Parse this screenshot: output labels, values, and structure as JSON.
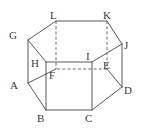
{
  "figure": {
    "name": "hexagonal-prism",
    "canvas": {
      "width": 142,
      "height": 130
    },
    "background_color": "#ffffff",
    "edge_color": "#59595c",
    "hidden_edge_color": "#6b6b70",
    "label_color": "#3a3a3d"
  },
  "vertices": [
    {
      "id": "A",
      "label": "A",
      "x": 28,
      "y": 83,
      "label_x": 10,
      "label_y": 80
    },
    {
      "id": "B",
      "label": "B",
      "x": 46,
      "y": 110,
      "label_x": 37,
      "label_y": 113
    },
    {
      "id": "C",
      "label": "C",
      "x": 92,
      "y": 110,
      "label_x": 85,
      "label_y": 113
    },
    {
      "id": "D",
      "label": "D",
      "x": 122,
      "y": 87,
      "label_x": 124,
      "label_y": 85
    },
    {
      "id": "E",
      "label": "E",
      "x": 107,
      "y": 69,
      "label_x": 103,
      "label_y": 60
    },
    {
      "id": "F",
      "label": "F",
      "x": 56,
      "y": 69,
      "label_x": 49,
      "label_y": 70
    },
    {
      "id": "G",
      "label": "G",
      "x": 28,
      "y": 40,
      "label_x": 9,
      "label_y": 30
    },
    {
      "id": "H",
      "label": "H",
      "x": 46,
      "y": 62,
      "label_x": 31,
      "label_y": 58
    },
    {
      "id": "I",
      "label": "I",
      "x": 92,
      "y": 62,
      "label_x": 86,
      "label_y": 51
    },
    {
      "id": "J",
      "label": "J",
      "x": 122,
      "y": 44,
      "label_x": 124,
      "label_y": 40
    },
    {
      "id": "K",
      "label": "K",
      "x": 107,
      "y": 21,
      "label_x": 103,
      "label_y": 10
    },
    {
      "id": "L",
      "label": "L",
      "x": 56,
      "y": 21,
      "label_x": 50,
      "label_y": 10
    }
  ],
  "edges": {
    "bottom_face": [
      {
        "from": "A",
        "to": "B",
        "style": "solid"
      },
      {
        "from": "B",
        "to": "C",
        "style": "solid"
      },
      {
        "from": "C",
        "to": "D",
        "style": "solid"
      },
      {
        "from": "D",
        "to": "E",
        "style": "solid"
      },
      {
        "from": "E",
        "to": "F",
        "style": "hidden"
      },
      {
        "from": "F",
        "to": "A",
        "style": "solid"
      }
    ],
    "top_face": [
      {
        "from": "G",
        "to": "H",
        "style": "solid"
      },
      {
        "from": "H",
        "to": "I",
        "style": "solid"
      },
      {
        "from": "I",
        "to": "J",
        "style": "solid"
      },
      {
        "from": "J",
        "to": "K",
        "style": "solid"
      },
      {
        "from": "K",
        "to": "L",
        "style": "solid"
      },
      {
        "from": "L",
        "to": "G",
        "style": "solid"
      }
    ],
    "vertical_edges": [
      {
        "from": "G",
        "to": "A",
        "style": "solid"
      },
      {
        "from": "H",
        "to": "B",
        "style": "solid"
      },
      {
        "from": "I",
        "to": "C",
        "style": "solid"
      },
      {
        "from": "J",
        "to": "D",
        "style": "solid"
      },
      {
        "from": "K",
        "to": "E",
        "style": "hidden"
      },
      {
        "from": "L",
        "to": "F",
        "style": "hidden"
      }
    ]
  }
}
